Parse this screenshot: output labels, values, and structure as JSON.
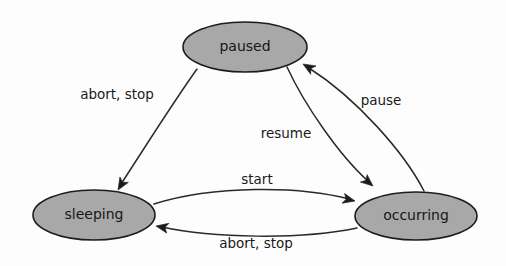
{
  "diagram": {
    "type": "state-transition-diagram",
    "title": "",
    "background_color": "#fdfdfd",
    "node_fill_color": "#a8a8a8",
    "node_stroke_color": "#1c1c1c",
    "edge_color": "#2a2a2a",
    "text_color": "#161616",
    "nodes": [
      {
        "id": "paused",
        "label": "paused",
        "cx": 245,
        "cy": 47,
        "rx": 62,
        "ry": 25
      },
      {
        "id": "sleeping",
        "label": "sleeping",
        "cx": 94,
        "cy": 215,
        "rx": 61,
        "ry": 25
      },
      {
        "id": "occurring",
        "label": "occurring",
        "cx": 416,
        "cy": 216,
        "rx": 61,
        "ry": 24
      }
    ],
    "edges": [
      {
        "id": "paused-to-sleeping",
        "from": "paused",
        "to": "sleeping",
        "label": "abort, stop",
        "label_x": 117,
        "label_y": 95,
        "path": "M 197 69 C 172 104 142 152 121 184",
        "arrow_x": 118,
        "arrow_y": 190,
        "arrow_angle": 123
      },
      {
        "id": "occurring-to-paused",
        "from": "occurring",
        "to": "paused",
        "label": "pause",
        "label_x": 381,
        "label_y": 101,
        "path": "M 424 191 C 404 152 356 98 309 68",
        "arrow_x": 303,
        "arrow_y": 64,
        "arrow_angle": 213
      },
      {
        "id": "paused-to-occurring",
        "from": "paused",
        "to": "occurring",
        "label": "resume",
        "label_x": 286,
        "label_y": 134,
        "path": "M 287 67 C 305 106 340 156 368 181",
        "arrow_x": 373,
        "arrow_y": 186,
        "arrow_angle": 42
      },
      {
        "id": "sleeping-to-occurring",
        "from": "sleeping",
        "to": "occurring",
        "label": "start",
        "label_x": 257,
        "label_y": 180,
        "path": "M 154 204 C 214 185 300 186 349 199",
        "arrow_x": 355,
        "arrow_y": 201,
        "arrow_angle": 15
      },
      {
        "id": "occurring-to-sleeping",
        "from": "occurring",
        "to": "sleeping",
        "label": "abort, stop",
        "label_x": 256,
        "label_y": 244,
        "path": "M 357 228 C 300 240 212 238 162 227",
        "arrow_x": 156,
        "arrow_y": 226,
        "arrow_angle": 193
      }
    ]
  }
}
